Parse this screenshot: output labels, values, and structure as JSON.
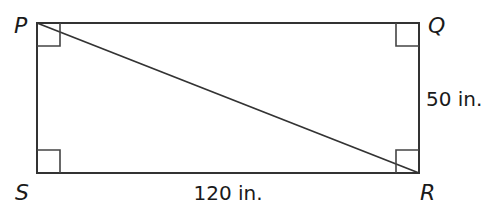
{
  "diagram": {
    "type": "rectangle",
    "vertices": {
      "P": {
        "label": "P"
      },
      "Q": {
        "label": "Q"
      },
      "R": {
        "label": "R"
      },
      "S": {
        "label": "S"
      }
    },
    "diagonal": "PR",
    "right_angles": [
      "P",
      "Q",
      "R",
      "S"
    ],
    "measurements": {
      "SR": "120 in.",
      "QR": "50 in."
    }
  },
  "colors": {
    "stroke": "#333333",
    "text": "#1a1a1a",
    "background": "#ffffff"
  }
}
